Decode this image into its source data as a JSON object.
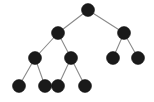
{
  "figure": {
    "background_color": "#ffffff",
    "node_color": "#1a1a1a",
    "edge_color": "#8a8a8a",
    "node_radius": 6.5,
    "edge_width": 1.1,
    "width": 154,
    "height": 102
  },
  "chart_data": {
    "type": "diagram",
    "diagram_kind": "binary-tree",
    "title": "",
    "node_count": 11,
    "edge_count": 10,
    "depth_levels": 4,
    "nodes": [
      {
        "id": "root",
        "label": "",
        "x": 88,
        "y": 10,
        "level": 0,
        "role": "root"
      },
      {
        "id": "n-l",
        "label": "",
        "x": 58,
        "y": 33,
        "level": 1,
        "role": "internal"
      },
      {
        "id": "n-r",
        "label": "",
        "x": 124,
        "y": 33,
        "level": 1,
        "role": "internal"
      },
      {
        "id": "n-ll",
        "label": "",
        "x": 35,
        "y": 58,
        "level": 2,
        "role": "internal"
      },
      {
        "id": "n-lr",
        "label": "",
        "x": 71,
        "y": 58,
        "level": 2,
        "role": "internal"
      },
      {
        "id": "n-rl",
        "label": "",
        "x": 113,
        "y": 58,
        "level": 2,
        "role": "leaf"
      },
      {
        "id": "n-rr",
        "label": "",
        "x": 138,
        "y": 58,
        "level": 2,
        "role": "leaf"
      },
      {
        "id": "n-lll",
        "label": "",
        "x": 19,
        "y": 86,
        "level": 3,
        "role": "leaf"
      },
      {
        "id": "n-llr",
        "label": "",
        "x": 45,
        "y": 86,
        "level": 3,
        "role": "leaf"
      },
      {
        "id": "n-lrl",
        "label": "",
        "x": 58,
        "y": 86,
        "level": 3,
        "role": "leaf"
      },
      {
        "id": "n-lrr",
        "label": "",
        "x": 85,
        "y": 86,
        "level": 3,
        "role": "leaf"
      }
    ],
    "edges": [
      {
        "from": "root",
        "to": "n-l"
      },
      {
        "from": "root",
        "to": "n-r"
      },
      {
        "from": "n-l",
        "to": "n-ll"
      },
      {
        "from": "n-l",
        "to": "n-lr"
      },
      {
        "from": "n-r",
        "to": "n-rl"
      },
      {
        "from": "n-r",
        "to": "n-rr"
      },
      {
        "from": "n-ll",
        "to": "n-lll"
      },
      {
        "from": "n-ll",
        "to": "n-llr"
      },
      {
        "from": "n-lr",
        "to": "n-lrl"
      },
      {
        "from": "n-lr",
        "to": "n-lrr"
      }
    ]
  }
}
